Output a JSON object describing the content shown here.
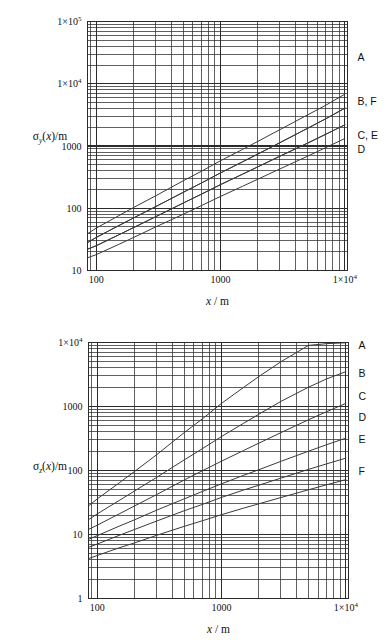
{
  "page": {
    "background": "#ffffff",
    "ink": "#1a1a1a",
    "grid_color": "#2b2b2b",
    "curve_color": "#3a3a3a",
    "caption_fragment": ""
  },
  "figures": [
    {
      "id": "sigma-y",
      "ylabel_main": "σ",
      "ylabel_sub": "y",
      "ylabel_rest": "(x)/m",
      "ylabel_plain": "σy(x)/m",
      "xlabel_italic": "x",
      "xlabel_rest": " / m",
      "xlabel_plain": "x / m",
      "x_ticks": [
        {
          "value": 100,
          "label": "100",
          "sup": ""
        },
        {
          "value": 1000,
          "label": "1000",
          "sup": ""
        },
        {
          "value": 10000,
          "label": "1×10",
          "sup": "4"
        }
      ],
      "y_ticks": [
        {
          "value": 10,
          "label": "10",
          "sup": ""
        },
        {
          "value": 100,
          "label": "100",
          "sup": ""
        },
        {
          "value": 1000,
          "label": "1000",
          "sup": ""
        },
        {
          "value": 10000,
          "label": "1×10",
          "sup": "4"
        },
        {
          "value": 100000,
          "label": "1×10",
          "sup": "5"
        }
      ],
      "curve_labels": [
        {
          "text": "A",
          "y_value": 26000
        },
        {
          "text": "B, F",
          "y_value": 5200
        },
        {
          "text": "C, E",
          "y_value": 1450
        },
        {
          "text": "D",
          "y_value": 880
        }
      ]
    },
    {
      "id": "sigma-z",
      "ylabel_main": "σ",
      "ylabel_sub": "z",
      "ylabel_rest": "(x)/m",
      "ylabel_plain": "σz(x)/m",
      "xlabel_italic": "x",
      "xlabel_rest": " / m",
      "xlabel_plain": "x / m",
      "x_ticks": [
        {
          "value": 100,
          "label": "100",
          "sup": ""
        },
        {
          "value": 1000,
          "label": "1000",
          "sup": ""
        },
        {
          "value": 10000,
          "label": "1×10",
          "sup": "4"
        }
      ],
      "y_ticks": [
        {
          "value": 1,
          "label": "1",
          "sup": ""
        },
        {
          "value": 10,
          "label": "10",
          "sup": ""
        },
        {
          "value": 100,
          "label": "100",
          "sup": ""
        },
        {
          "value": 1000,
          "label": "1000",
          "sup": ""
        },
        {
          "value": 10000,
          "label": "1×10",
          "sup": "4"
        }
      ],
      "curve_labels": [
        {
          "text": "A",
          "y_value": 9000
        },
        {
          "text": "B",
          "y_value": 3300
        },
        {
          "text": "C",
          "y_value": 1450
        },
        {
          "text": "D",
          "y_value": 680
        },
        {
          "text": "E",
          "y_value": 300
        },
        {
          "text": "F",
          "y_value": 96
        }
      ]
    }
  ],
  "chart_data": [
    {
      "type": "line",
      "id": "sigma-y",
      "title": "",
      "xlabel": "x / m",
      "ylabel": "σy(x)/m",
      "xscale": "log",
      "yscale": "log",
      "xlim": [
        85,
        10500
      ],
      "ylim": [
        10,
        100000
      ],
      "grid": "log-minor",
      "legend": "right-edge-labels",
      "x": [
        85,
        100,
        150,
        200,
        300,
        500,
        700,
        1000,
        1500,
        2000,
        3000,
        5000,
        7000,
        10000
      ],
      "series": [
        {
          "name": "A",
          "label": "A",
          "values": [
            39,
            48,
            75,
            103,
            158,
            276,
            392,
            580,
            880,
            1190,
            1830,
            3150,
            4500,
            6800
          ]
        },
        {
          "name": "B",
          "label": "B, F",
          "values": [
            28,
            34,
            52,
            70,
            106,
            180,
            254,
            370,
            556,
            745,
            1130,
            1920,
            2730,
            4050
          ]
        },
        {
          "name": "C",
          "label": "C, E",
          "values": [
            22,
            25,
            37,
            49,
            73,
            121,
            168,
            240,
            352,
            464,
            686,
            1110,
            1540,
            2190
          ]
        },
        {
          "name": "D",
          "label": "D",
          "values": [
            16,
            18,
            26,
            34,
            50,
            80,
            110,
            155,
            225,
            294,
            428,
            684,
            940,
            1320
          ]
        },
        {
          "name": "E",
          "label": "C, E",
          "values": [
            22,
            25,
            37,
            49,
            73,
            121,
            168,
            240,
            352,
            464,
            686,
            1110,
            1540,
            2190
          ]
        },
        {
          "name": "F",
          "label": "B, F",
          "values": [
            28,
            34,
            52,
            70,
            106,
            180,
            254,
            370,
            556,
            745,
            1130,
            1920,
            2730,
            4050
          ]
        }
      ]
    },
    {
      "type": "line",
      "id": "sigma-z",
      "title": "",
      "xlabel": "x / m",
      "ylabel": "σz(x)/m",
      "xscale": "log",
      "yscale": "log",
      "xlim": [
        85,
        10500
      ],
      "ylim": [
        1,
        10000
      ],
      "grid": "log-minor",
      "legend": "right-edge-labels",
      "x": [
        85,
        100,
        150,
        200,
        300,
        500,
        700,
        1000,
        1500,
        2000,
        3000,
        5000,
        7000,
        10000
      ],
      "series": [
        {
          "name": "A",
          "label": "A",
          "values": [
            28,
            36,
            64,
            97,
            176,
            390,
            640,
            1120,
            1980,
            2950,
            5000,
            9000,
            9600,
            9900
          ]
        },
        {
          "name": "B",
          "label": "B",
          "values": [
            17,
            21,
            34,
            48,
            78,
            146,
            219,
            340,
            545,
            760,
            1200,
            2000,
            2700,
            3500
          ]
        },
        {
          "name": "C",
          "label": "C",
          "values": [
            12,
            14,
            21,
            28,
            42,
            71,
            99,
            140,
            205,
            268,
            390,
            620,
            830,
            1120
          ]
        },
        {
          "name": "D",
          "label": "D",
          "values": [
            8.4,
            9.6,
            13.5,
            17.0,
            24.0,
            36.0,
            47.0,
            62.0,
            84.0,
            103,
            139,
            200,
            253,
            320
          ]
        },
        {
          "name": "E",
          "label": "E",
          "values": [
            6.3,
            7.1,
            9.7,
            12.0,
            16.2,
            23.5,
            29.5,
            38.0,
            49.5,
            59.0,
            76.0,
            104,
            127,
            156
          ]
        },
        {
          "name": "F",
          "label": "F",
          "values": [
            4.2,
            4.7,
            6.2,
            7.4,
            9.7,
            13.4,
            16.4,
            20.4,
            25.8,
            30.2,
            37.8,
            50.0,
            59.8,
            72.0
          ]
        }
      ]
    }
  ]
}
